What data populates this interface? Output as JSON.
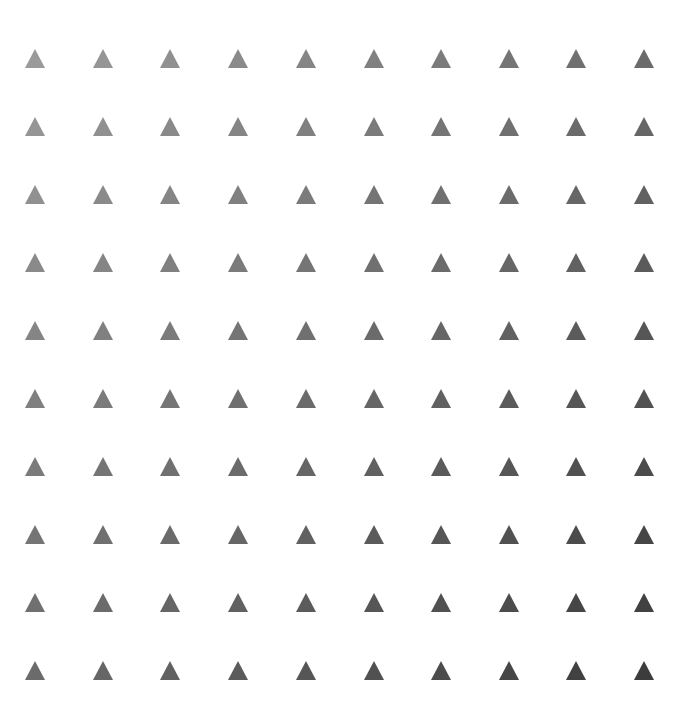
{
  "pattern": {
    "shape": "triangle-up",
    "rows": 10,
    "cols": 10,
    "triangle_width": 20,
    "triangle_height": 19,
    "col_centers": [
      35,
      103,
      170,
      238,
      306,
      374,
      441,
      509,
      576,
      644
    ],
    "row_tops": [
      49,
      117,
      185,
      253,
      321,
      389,
      457,
      525,
      593,
      661
    ],
    "color_top_left": "#9a9a9a",
    "color_bottom_right": "#3c3c3c",
    "background": "#ffffff"
  }
}
